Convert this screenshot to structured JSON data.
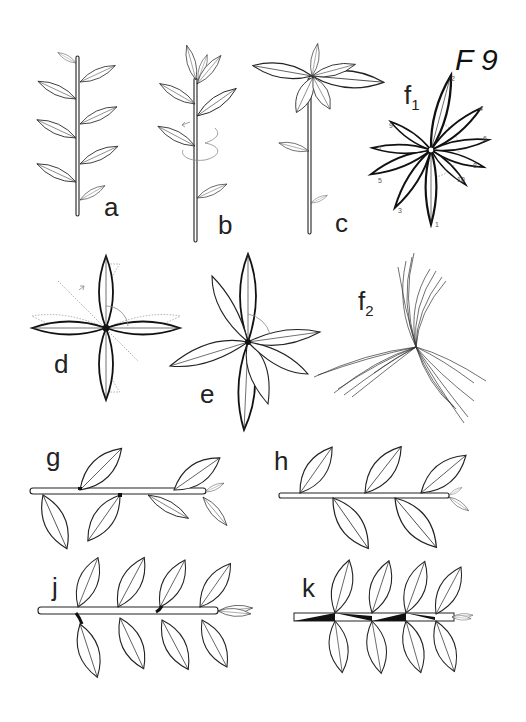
{
  "figure": {
    "title": "F 9",
    "panels": [
      {
        "id": "a",
        "label": "a",
        "description": "upright shoot, alternate distichous leaves"
      },
      {
        "id": "b",
        "label": "b",
        "description": "upright shoot, spiral leaf arrangement with rotation arrow"
      },
      {
        "id": "c",
        "label": "c",
        "description": "shoot with terminal rosette of leaves"
      },
      {
        "id": "f1",
        "label": "f",
        "sub": "1",
        "description": "spiral phyllotaxis top view, leaves numbered 1-10",
        "leaf_numbers": [
          "1",
          "2",
          "3",
          "4",
          "5",
          "6",
          "7",
          "8",
          "9",
          "10"
        ]
      },
      {
        "id": "d",
        "label": "d",
        "description": "decussate leaf pairs, top view with dotted rotation"
      },
      {
        "id": "e",
        "label": "e",
        "description": "decussate leaves with rotation, top view"
      },
      {
        "id": "f2",
        "label": "f",
        "sub": "2",
        "description": "needle-like leaves in three-part whorl"
      },
      {
        "id": "g",
        "label": "g",
        "description": "horizontal shoot, alternate leaves with twisted petioles"
      },
      {
        "id": "h",
        "label": "h",
        "description": "horizontal shoot, alternate distichous leaves"
      },
      {
        "id": "j",
        "label": "j",
        "description": "horizontal shoot, opposite leaves with twisted bases"
      },
      {
        "id": "k",
        "label": "k",
        "description": "horizontal shoot, opposite leaves, stem with dark wedges"
      }
    ]
  }
}
